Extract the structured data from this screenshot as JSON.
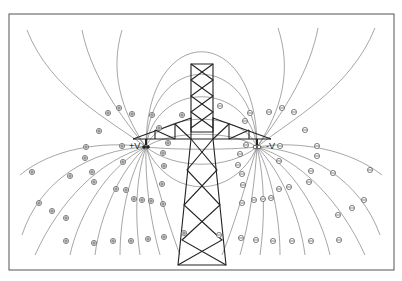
{
  "diagram": {
    "title": "",
    "labels": {
      "positive_conductor": "+V",
      "negative_conductor": "-V"
    },
    "positive_ion_symbol": "⊕",
    "negative_ion_symbol": "⊖",
    "colors": {
      "line": "#6a6a6a",
      "tower": "#222222",
      "frame": "#555555",
      "background": "#ffffff"
    }
  }
}
